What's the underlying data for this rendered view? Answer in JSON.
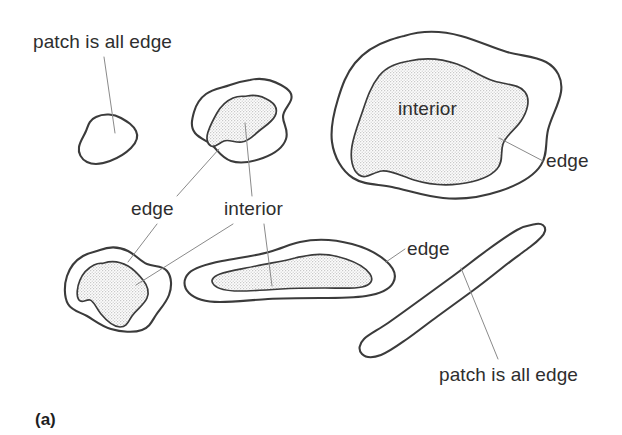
{
  "figure": {
    "caption": "(a)",
    "stroke_color": "#3b3b3b",
    "leader_color": "#8a8a8a",
    "interior_fill_color": "#e9e9e9",
    "background_color": "#ffffff"
  },
  "labels": {
    "patch_all_edge_top": "patch is all edge",
    "edge_mid_left": "edge",
    "interior_mid": "interior",
    "interior_big": "interior",
    "edge_big_right": "edge",
    "edge_elongated": "edge",
    "patch_all_edge_bottom": "patch is all edge"
  },
  "shapes": [
    {
      "name": "small-blob-top-left",
      "kind": "all-edge",
      "has_interior": false,
      "label": "patch is all edge"
    },
    {
      "name": "medium-blob-top-middle",
      "kind": "edge-and-interior",
      "has_interior": true,
      "labels": [
        "edge",
        "interior"
      ]
    },
    {
      "name": "large-blob-right",
      "kind": "edge-and-interior",
      "has_interior": true,
      "labels": [
        "interior",
        "edge"
      ]
    },
    {
      "name": "medium-blob-bottom-left",
      "kind": "edge-and-interior",
      "has_interior": true,
      "labels": [
        "edge",
        "interior"
      ]
    },
    {
      "name": "elongated-blob-bottom-middle",
      "kind": "edge-and-interior",
      "has_interior": true,
      "labels": [
        "interior",
        "edge"
      ]
    },
    {
      "name": "thin-strip-bottom-right",
      "kind": "all-edge",
      "has_interior": false,
      "label": "patch is all edge"
    }
  ]
}
